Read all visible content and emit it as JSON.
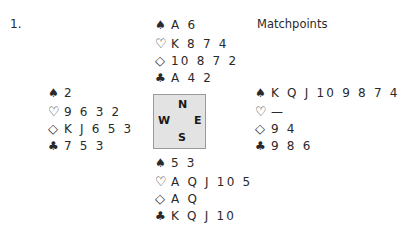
{
  "problem_number": "1.",
  "scoring": "Matchpoints",
  "suit_symbols": {
    "spades": "♠",
    "hearts": "♡",
    "diamonds": "◇",
    "clubs": "♣"
  },
  "compass": {
    "north": "N",
    "west": "W",
    "east": "E",
    "south": "S"
  },
  "hands": {
    "north": {
      "spades": "A 6",
      "hearts": "K 8 7 4",
      "diamonds": "10 8 7 2",
      "clubs": "A 4 2"
    },
    "west": {
      "spades": "2",
      "hearts": "9 6 3 2",
      "diamonds": "K J 6 5 3",
      "clubs": "7 5 3"
    },
    "east": {
      "spades": "K Q J 10 9 8 7 4",
      "hearts": "—",
      "diamonds": "9 4",
      "clubs": "9 8 6"
    },
    "south": {
      "spades": "5 3",
      "hearts": "A Q J 10 5",
      "diamonds": "A Q",
      "clubs": "K Q J 10"
    }
  }
}
